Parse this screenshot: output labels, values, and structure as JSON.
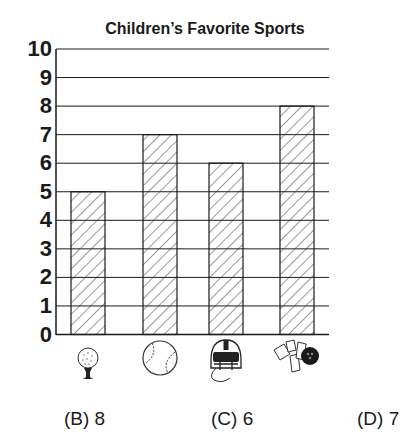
{
  "chart_data": {
    "type": "bar",
    "title": "Children’s Favorite Sports",
    "xlabel": "",
    "ylabel": "",
    "categories": [
      "golf",
      "baseball",
      "football",
      "bowling"
    ],
    "category_icons": [
      "golf-ball-on-tee-icon",
      "baseball-icon",
      "football-helmet-icon",
      "bowling-pins-and-ball-icon"
    ],
    "values": [
      5,
      7,
      6,
      8
    ],
    "ylim": [
      0,
      10
    ],
    "yticks": [
      0,
      1,
      2,
      3,
      4,
      5,
      6,
      7,
      8,
      9,
      10
    ],
    "grid": true,
    "bar_fill": "diagonal-hatch",
    "legend": null
  },
  "question": {
    "options": [
      {
        "letter": "(B)",
        "value": "8"
      },
      {
        "letter": "(C)",
        "value": "6"
      },
      {
        "letter": "(D)",
        "value": "7"
      }
    ]
  },
  "colors": {
    "line": "#1a1a1a",
    "hatch": "#333333",
    "background": "#ffffff"
  }
}
